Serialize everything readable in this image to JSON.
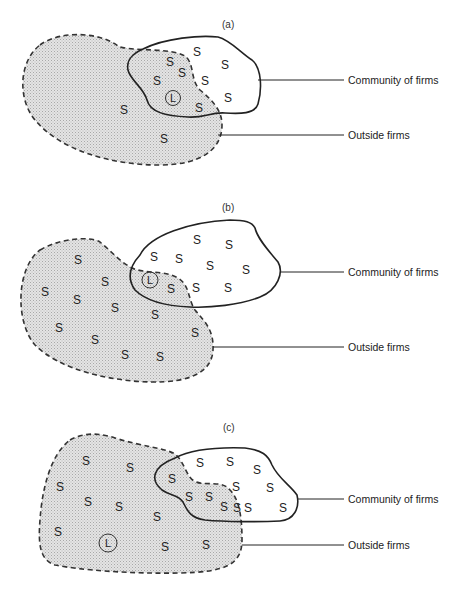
{
  "figure": {
    "panels": [
      {
        "id": "a",
        "label": "(a)",
        "community_label": "Community of firms",
        "outside_label": "Outside firms",
        "s_marks": [
          {
            "x": 197,
            "y": 56,
            "t": "S"
          },
          {
            "x": 170,
            "y": 66,
            "t": "S"
          },
          {
            "x": 225,
            "y": 69,
            "t": "S"
          },
          {
            "x": 182,
            "y": 77,
            "t": "S"
          },
          {
            "x": 157,
            "y": 85,
            "t": "S"
          },
          {
            "x": 205,
            "y": 85,
            "t": "S"
          },
          {
            "x": 228,
            "y": 102,
            "t": "S"
          },
          {
            "x": 199,
            "y": 112,
            "t": "S"
          },
          {
            "x": 124,
            "y": 114,
            "t": "S"
          },
          {
            "x": 164,
            "y": 143,
            "t": "S"
          }
        ],
        "leader": {
          "x": 173,
          "y": 98,
          "t": "L"
        }
      },
      {
        "id": "b",
        "label": "(b)",
        "community_label": "Community of firms",
        "outside_label": "Outside firms",
        "s_marks": [
          {
            "x": 197,
            "y": 244,
            "t": "S"
          },
          {
            "x": 229,
            "y": 249,
            "t": "S"
          },
          {
            "x": 154,
            "y": 261,
            "t": "S"
          },
          {
            "x": 179,
            "y": 263,
            "t": "S"
          },
          {
            "x": 210,
            "y": 270,
            "t": "S"
          },
          {
            "x": 246,
            "y": 274,
            "t": "S"
          },
          {
            "x": 171,
            "y": 293,
            "t": "S"
          },
          {
            "x": 196,
            "y": 292,
            "t": "S"
          },
          {
            "x": 228,
            "y": 292,
            "t": "S"
          },
          {
            "x": 78,
            "y": 264,
            "t": "S"
          },
          {
            "x": 105,
            "y": 286,
            "t": "S"
          },
          {
            "x": 45,
            "y": 296,
            "t": "S"
          },
          {
            "x": 77,
            "y": 304,
            "t": "S"
          },
          {
            "x": 115,
            "y": 312,
            "t": "S"
          },
          {
            "x": 155,
            "y": 319,
            "t": "S"
          },
          {
            "x": 59,
            "y": 332,
            "t": "S"
          },
          {
            "x": 95,
            "y": 344,
            "t": "S"
          },
          {
            "x": 195,
            "y": 337,
            "t": "S"
          },
          {
            "x": 125,
            "y": 359,
            "t": "S"
          },
          {
            "x": 160,
            "y": 361,
            "t": "S"
          }
        ],
        "leader": {
          "x": 150,
          "y": 280,
          "t": "L"
        }
      },
      {
        "id": "c",
        "label": "(c)",
        "community_label": "Community of firms",
        "outside_label": "Outside firms",
        "s_marks": [
          {
            "x": 86,
            "y": 465,
            "t": "S"
          },
          {
            "x": 130,
            "y": 472,
            "t": "S"
          },
          {
            "x": 60,
            "y": 491,
            "t": "S"
          },
          {
            "x": 88,
            "y": 506,
            "t": "S"
          },
          {
            "x": 119,
            "y": 511,
            "t": "S"
          },
          {
            "x": 157,
            "y": 521,
            "t": "S"
          },
          {
            "x": 172,
            "y": 483,
            "t": "S"
          },
          {
            "x": 189,
            "y": 501,
            "t": "S"
          },
          {
            "x": 209,
            "y": 501,
            "t": "S"
          },
          {
            "x": 224,
            "y": 511,
            "t": "S"
          },
          {
            "x": 58,
            "y": 536,
            "t": "S"
          },
          {
            "x": 165,
            "y": 551,
            "t": "S"
          },
          {
            "x": 206,
            "y": 549,
            "t": "S"
          },
          {
            "x": 200,
            "y": 467,
            "t": "S"
          },
          {
            "x": 230,
            "y": 466,
            "t": "S"
          },
          {
            "x": 257,
            "y": 474,
            "t": "S"
          },
          {
            "x": 236,
            "y": 491,
            "t": "S"
          },
          {
            "x": 237,
            "y": 512,
            "t": "S"
          },
          {
            "x": 270,
            "y": 492,
            "t": "S"
          },
          {
            "x": 248,
            "y": 512,
            "t": "S"
          },
          {
            "x": 283,
            "y": 512,
            "t": "S"
          }
        ],
        "leader": {
          "x": 108,
          "y": 543,
          "t": "L"
        }
      }
    ]
  }
}
